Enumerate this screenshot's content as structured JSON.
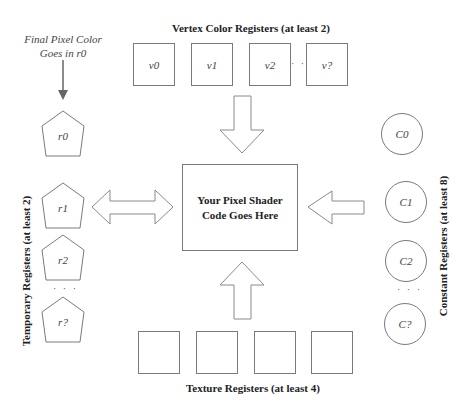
{
  "diagram": {
    "vertex": {
      "heading": "Vertex Color Registers (at least 2)",
      "registers": [
        "v0",
        "v1",
        "v2",
        "v?"
      ],
      "ellipsis": "· · ·"
    },
    "center": {
      "line1": "Your Pixel Shader",
      "line2": "Code Goes Here"
    },
    "temporary": {
      "heading": "Temporary Registers (at least 2)",
      "registers": [
        "r0",
        "r1",
        "r2",
        "r?"
      ],
      "ellipsis": "· · ·",
      "note_line1": "Final Pixel Color",
      "note_line2": "Goes in r0"
    },
    "constant": {
      "heading": "Constant Registers (at least 8)",
      "registers": [
        "C0",
        "C1",
        "C2",
        "C?"
      ],
      "ellipsis": "· · ·"
    },
    "texture": {
      "heading": "Texture Registers (at least 4)",
      "registers": [
        "",
        "",
        "",
        ""
      ]
    },
    "colors": {
      "stroke": "#7a7a7a",
      "background": "#ffffff",
      "text": "#222222"
    }
  }
}
